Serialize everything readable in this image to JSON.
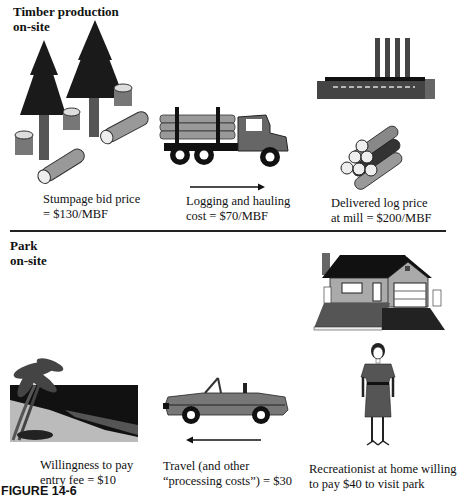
{
  "top_section": {
    "title_line1": "Timber production",
    "title_line2": "on-site",
    "captions": [
      {
        "line1": "Stumpage bid price",
        "line2": "= $130/MBF"
      },
      {
        "line1": "Logging and hauling",
        "line2": "cost = $70/MBF"
      },
      {
        "line1": "Delivered log price",
        "line2": "at mill = $200/MBF"
      }
    ],
    "flow_direction": "right"
  },
  "bottom_section": {
    "title_line1": "Park",
    "title_line2": "on-site",
    "captions": [
      {
        "line1": "Willingness to pay",
        "line2": "entry fee = $10"
      },
      {
        "line1": "Travel (and other",
        "line2": "“processing costs”) = $30"
      },
      {
        "line1": "Recreationist at home willing",
        "line2": "to pay $40 to visit park"
      }
    ],
    "flow_direction": "left"
  },
  "figure_label": "FIGURE 14-6",
  "colors": {
    "dark": "#1a1a1a",
    "mid": "#555555",
    "light": "#9a9a9a",
    "pale": "#cfcfcf"
  }
}
